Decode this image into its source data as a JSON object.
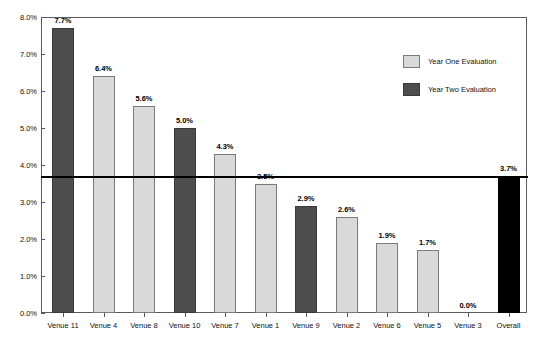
{
  "chart_data": {
    "type": "bar",
    "title": "",
    "xlabel": "",
    "ylabel": "",
    "ylim": [
      0.0,
      8.0
    ],
    "ytick_labels": [
      "0.0%",
      "1.0%",
      "2.0%",
      "3.0%",
      "4.0%",
      "5.0%",
      "6.0%",
      "7.0%",
      "8.0%"
    ],
    "ytick_values": [
      0.0,
      1.0,
      2.0,
      3.0,
      4.0,
      5.0,
      6.0,
      7.0,
      8.0
    ],
    "grid": false,
    "legend_position": "upper-right",
    "categories": [
      "Venue 11",
      "Venue 4",
      "Venue 8",
      "Venue 10",
      "Venue 7",
      "Venue 1",
      "Venue 9",
      "Venue 2",
      "Venue 6",
      "Venue 5",
      "Venue 3",
      "Overall"
    ],
    "values": [
      7.7,
      6.4,
      5.6,
      5.0,
      4.3,
      3.5,
      2.9,
      2.6,
      1.9,
      1.7,
      0.0,
      3.7
    ],
    "value_labels": [
      "7.7%",
      "6.4%",
      "5.6%",
      "5.0%",
      "4.3%",
      "3.5%",
      "2.9%",
      "2.6%",
      "1.9%",
      "1.7%",
      "0.0%",
      "3.7%"
    ],
    "bar_groups": [
      "year_two",
      "year_one",
      "year_one",
      "year_two",
      "year_one",
      "year_one",
      "year_two",
      "year_one",
      "year_one",
      "year_one",
      "year_one",
      "overall"
    ],
    "reference_line": {
      "value": 3.7,
      "label": "3.7%"
    },
    "legend": [
      {
        "label": "Year One Evaluation",
        "key": "year_one",
        "color": "#d9d9d9"
      },
      {
        "label": "Year Two Evaluation",
        "key": "year_two",
        "color": "#4d4d4d"
      }
    ],
    "colors": {
      "year_one": "#d9d9d9",
      "year_two": "#4d4d4d",
      "overall": "#000000",
      "axis": "#5a5a5a",
      "reference_line": "#000000",
      "background": "#ffffff"
    }
  }
}
